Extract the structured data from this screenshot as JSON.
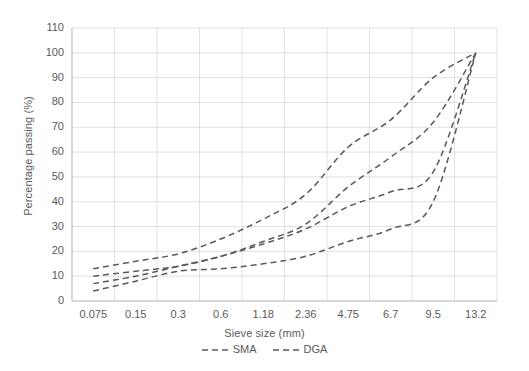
{
  "chart_data": {
    "type": "line",
    "title": "",
    "xlabel": "Sieve size (mm)",
    "ylabel": "Percentage passing (%)",
    "categories": [
      "0.075",
      "0.15",
      "0.3",
      "0.6",
      "1.18",
      "2.36",
      "4.75",
      "6.7",
      "9.5",
      "13.2"
    ],
    "x_tick_labels": [
      "0.075",
      "0.15",
      "0.3",
      "0.6",
      "1.18",
      "2.36",
      "4.75",
      "6.7",
      "9.5",
      "13.2"
    ],
    "y_tick_labels": [
      "0",
      "10",
      "20",
      "30",
      "40",
      "50",
      "60",
      "70",
      "80",
      "90",
      "100",
      "110"
    ],
    "ylim": [
      0,
      110
    ],
    "y_major_step": 10,
    "grid": true,
    "grid_color": "#d9d9d9",
    "legend_position": "bottom",
    "line_style": "dashed",
    "line_color": "#595959",
    "series": [
      {
        "name": "SMA upper",
        "legend": "SMA",
        "values": [
          13,
          16,
          19,
          25,
          33,
          43,
          62,
          73,
          90,
          100
        ]
      },
      {
        "name": "SMA lower",
        "legend": "SMA",
        "values": [
          10,
          12,
          14,
          18,
          24,
          31,
          46,
          58,
          72,
          100
        ]
      },
      {
        "name": "DGA upper",
        "legend": "DGA",
        "values": [
          7,
          10,
          14,
          18,
          23,
          29,
          38,
          44,
          52,
          100
        ]
      },
      {
        "name": "DGA lower",
        "legend": "DGA",
        "values": [
          4,
          8,
          12,
          13,
          15,
          18,
          24,
          29,
          40,
          100
        ]
      }
    ],
    "legend_entries": [
      {
        "label": "SMA",
        "color": "#595959",
        "style": "dashed"
      },
      {
        "label": "DGA",
        "color": "#595959",
        "style": "dashed"
      }
    ]
  }
}
